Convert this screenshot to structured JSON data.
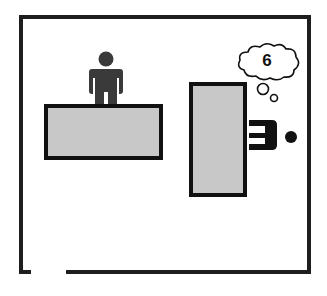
{
  "diagram": {
    "title": "",
    "room": {
      "label": "room-floorplan",
      "wall_color": "#1e1e1e",
      "has_door_gap": true
    },
    "desks": [
      {
        "id": "front-desk",
        "fill": "#c8c8c8",
        "border": "#111111"
      },
      {
        "id": "side-desk",
        "fill": "#c8c8c8",
        "border": "#111111"
      }
    ],
    "people": [
      {
        "id": "standing-person",
        "pose": "standing",
        "color": "#3a3a3a"
      },
      {
        "id": "seated-person",
        "pose": "seated-top-view",
        "color": "#111111"
      }
    ],
    "thought_bubble": {
      "text": "6"
    }
  }
}
